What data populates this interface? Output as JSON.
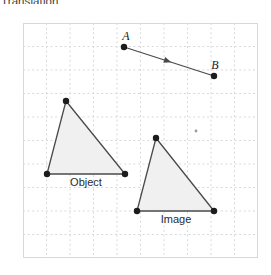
{
  "heading": {
    "text": "Translation",
    "clipped": true
  },
  "grid": {
    "frame": {
      "x": 23,
      "y": 23,
      "width": 235,
      "height": 258
    },
    "cell_size": 23.5,
    "columns": 10,
    "rows": 10,
    "line_style": "dotted",
    "line_color": "#d9d9d9",
    "border_color": "#d8d8d8",
    "background": "#ffffff",
    "show_grid": true
  },
  "style": {
    "vertex_color": "#1c1c1c",
    "edge_color": "#4a4a4a",
    "fill_color": "#f0f0f0",
    "vector_color": "#4a4a4a",
    "label_color": "#2b2b2b",
    "vertex_radius": 3.2,
    "edge_width": 1.3
  },
  "chart_data": {
    "type": "diagram",
    "title": "Translation",
    "subtitle": "",
    "xlabel": "",
    "ylabel": "",
    "grid": true,
    "legend_position": "inline-labels",
    "annotations": [
      {
        "name": "A",
        "x": 124,
        "y": 47,
        "role": "vector-tail"
      },
      {
        "name": "B",
        "x": 214,
        "y": 76,
        "role": "vector-head"
      },
      {
        "name": "Object",
        "x": 86,
        "y": 186,
        "role": "shape-label"
      },
      {
        "name": "Image",
        "x": 176,
        "y": 223,
        "role": "shape-label"
      }
    ],
    "vector": {
      "name": "AB",
      "from_label": "A",
      "to_label": "B",
      "from": {
        "x": 124,
        "y": 47
      },
      "to": {
        "x": 214,
        "y": 76
      },
      "translation": {
        "dx": 90,
        "dy": 29
      },
      "arrow_at": "midpoint",
      "style": "solid"
    },
    "series": [
      {
        "name": "Object",
        "type": "polygon",
        "label": "Object",
        "filled": true,
        "vertices": [
          {
            "x": 66,
            "y": 101
          },
          {
            "x": 47,
            "y": 174
          },
          {
            "x": 125,
            "y": 174
          }
        ]
      },
      {
        "name": "Image",
        "type": "polygon",
        "label": "Image",
        "filled": true,
        "vertices": [
          {
            "x": 156,
            "y": 138
          },
          {
            "x": 137,
            "y": 211
          },
          {
            "x": 214,
            "y": 211
          }
        ]
      }
    ],
    "stray_marks": [
      {
        "x": 196,
        "y": 131,
        "size": 1.4
      }
    ]
  }
}
